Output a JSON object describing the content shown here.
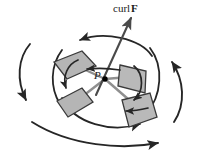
{
  "figure": {
    "background_color": "#ffffff",
    "labels": {
      "curl_vector_prefix": "curl",
      "curl_vector_symbol": "F",
      "point_label": "P"
    },
    "colors": {
      "paddle_fill": "#b5b5b5",
      "paddle_fill_light": "#c4c4c4",
      "paddle_stroke": "#3a3a3a",
      "axis_line": "#8c8c8c",
      "arrow_stroke": "#262626",
      "vector_stroke": "#4a4a4a",
      "point_dot": "#000000"
    },
    "elements": {
      "paddles": [
        {
          "name": "paddle-upper-left",
          "points": "54,62 82,52 95,67 66,79"
        },
        {
          "name": "paddle-right",
          "points": "120,66 146,72 144,92 118,86"
        },
        {
          "name": "paddle-lower-left",
          "points": "58,101 82,89 92,103 68,117"
        },
        {
          "name": "paddle-lower-right",
          "points": "122,101 150,94 156,117 128,126"
        }
      ],
      "axis_lines": [
        {
          "name": "axis-upper-left",
          "x1": 105,
          "y1": 79,
          "x2": 66,
          "y2": 62
        },
        {
          "name": "axis-right",
          "x1": 105,
          "y1": 79,
          "x2": 140,
          "y2": 76
        },
        {
          "name": "axis-lower-left",
          "x1": 105,
          "y1": 79,
          "x2": 70,
          "y2": 106
        },
        {
          "name": "axis-lower-right",
          "x1": 105,
          "y1": 79,
          "x2": 142,
          "y2": 111
        }
      ],
      "curl_vector": {
        "name": "curl-vector-arrow",
        "x1": 97,
        "y1": 93,
        "x2": 130,
        "y2": 19
      },
      "center_point": {
        "name": "point-p-dot",
        "cx": 105,
        "cy": 79,
        "r": 2.6
      },
      "circulation_arcs": [
        {
          "name": "arc-top-inner",
          "direction": "left"
        },
        {
          "name": "arc-middle-inner",
          "direction": "left"
        },
        {
          "name": "arc-bottom-inner",
          "direction": "right"
        }
      ],
      "outer_arrows": [
        {
          "name": "outer-arrow-left",
          "direction": "down"
        },
        {
          "name": "outer-arrow-right",
          "direction": "up"
        },
        {
          "name": "outer-arrow-top",
          "direction": "left"
        },
        {
          "name": "outer-arrow-bottom",
          "direction": "right"
        }
      ],
      "paddle_spin_arrows": [
        {
          "name": "spin-arrow-upper-left"
        },
        {
          "name": "spin-arrow-right"
        }
      ]
    }
  }
}
